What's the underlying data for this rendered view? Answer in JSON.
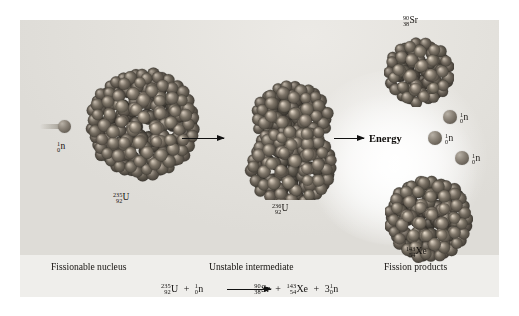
{
  "figure": {
    "background_color": "#e6e4df",
    "nucleon_color": "#7d7367"
  },
  "labels": {
    "incoming_neutron": {
      "mass": "1",
      "atomic": "0",
      "symbol": "n"
    },
    "u235": {
      "mass": "235",
      "atomic": "92",
      "symbol": "U"
    },
    "u236": {
      "mass": "236",
      "atomic": "92",
      "symbol": "U"
    },
    "sr90": {
      "mass": "90",
      "atomic": "38",
      "symbol": "Sr"
    },
    "xe143": {
      "mass": "143",
      "atomic": "54",
      "symbol": "Xe"
    },
    "neutron_a": {
      "mass": "1",
      "atomic": "0",
      "symbol": "n"
    },
    "neutron_b": {
      "mass": "1",
      "atomic": "0",
      "symbol": "n"
    },
    "neutron_c": {
      "mass": "1",
      "atomic": "0",
      "symbol": "n"
    },
    "energy": "Energy"
  },
  "captions": {
    "left": "Fissionable nucleus",
    "middle": "Unstable intermediate",
    "right": "Fission products"
  },
  "equation": {
    "reactant_1": {
      "mass": "235",
      "atomic": "92",
      "symbol": "U"
    },
    "plus_1": "+",
    "reactant_2": {
      "mass": "1",
      "atomic": "0",
      "symbol": "n"
    },
    "yields": "⟶",
    "product_1": {
      "mass": "90",
      "atomic": "38",
      "symbol": "Sr"
    },
    "plus_2": "+",
    "product_2": {
      "mass": "143",
      "atomic": "54",
      "symbol": "Xe"
    },
    "plus_3": "+",
    "product_3": {
      "coefficient": "3",
      "mass": "1",
      "atomic": "0",
      "symbol": "n"
    }
  },
  "nuclei": {
    "u235": {
      "kind": "sphere",
      "radius": 52,
      "nucleons": 235
    },
    "u236": {
      "kind": "dumbbell",
      "radius": 40,
      "nucleons": 236
    },
    "sr90": {
      "kind": "sphere",
      "radius": 30,
      "nucleons": 90
    },
    "xe143": {
      "kind": "sphere",
      "radius": 38,
      "nucleons": 143
    }
  }
}
